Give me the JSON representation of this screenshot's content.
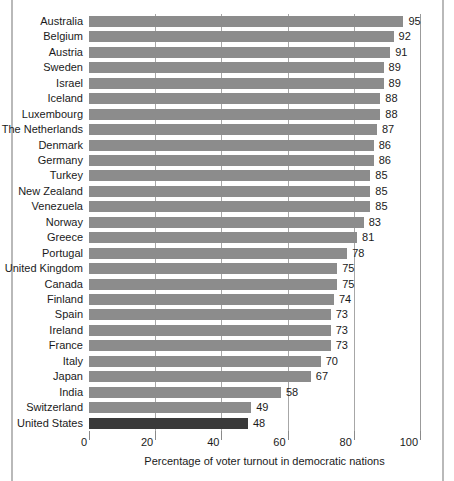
{
  "chart_data": {
    "type": "bar",
    "orientation": "horizontal",
    "title": "",
    "subtitle": "",
    "xlabel": "Percentage of voter turnout in democratic nations",
    "ylabel": "",
    "xlim": [
      0,
      100
    ],
    "xticks": [
      0,
      20,
      40,
      60,
      80,
      100
    ],
    "xtick_labels": [
      "0",
      "20",
      "40",
      "60",
      "80",
      "100"
    ],
    "grid": true,
    "grid_axis": "x",
    "legend": false,
    "bar_color": "#8c8c8c",
    "highlight_color": "#3a3a3a",
    "highlight_category": "United States",
    "categories": [
      "Australia",
      "Belgium",
      "Austria",
      "Sweden",
      "Israel",
      "Iceland",
      "Luxembourg",
      "The Netherlands",
      "Denmark",
      "Germany",
      "Turkey",
      "New Zealand",
      "Venezuela",
      "Norway",
      "Greece",
      "Portugal",
      "United Kingdom",
      "Canada",
      "Finland",
      "Spain",
      "Ireland",
      "France",
      "Italy",
      "Japan",
      "India",
      "Switzerland",
      "United States"
    ],
    "values": [
      95,
      92,
      91,
      89,
      89,
      88,
      88,
      87,
      86,
      86,
      85,
      85,
      85,
      83,
      81,
      78,
      75,
      75,
      74,
      73,
      73,
      73,
      70,
      67,
      58,
      49,
      48
    ],
    "value_labels": [
      "95",
      "92",
      "91",
      "89",
      "89",
      "88",
      "88",
      "87",
      "86",
      "86",
      "85",
      "85",
      "85",
      "83",
      "81",
      "78",
      "75",
      "75",
      "74",
      "73",
      "73",
      "73",
      "70",
      "67",
      "58",
      "49",
      "48"
    ]
  }
}
